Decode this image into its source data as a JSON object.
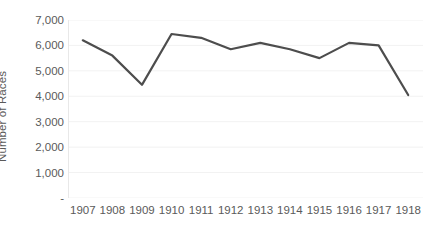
{
  "chart_data": {
    "type": "line",
    "title": "",
    "xlabel": "",
    "ylabel": "Number of Races",
    "categories": [
      "1907",
      "1908",
      "1909",
      "1910",
      "1911",
      "1912",
      "1913",
      "1914",
      "1915",
      "1916",
      "1917",
      "1918"
    ],
    "values": [
      6200,
      5600,
      4450,
      6450,
      6300,
      5850,
      6100,
      5850,
      5500,
      6100,
      6000,
      4050
    ],
    "series": [
      {
        "name": "Number of Races",
        "values": [
          6200,
          5600,
          4450,
          6450,
          6300,
          5850,
          6100,
          5850,
          5500,
          6100,
          6000,
          4050
        ]
      }
    ],
    "ylim": [
      0,
      7000
    ],
    "ytick_values": [
      0,
      1000,
      2000,
      3000,
      4000,
      5000,
      6000,
      7000
    ],
    "ytick_labels": [
      "-",
      "1,000",
      "2,000",
      "3,000",
      "4,000",
      "5,000",
      "6,000",
      "7,000"
    ],
    "grid": true,
    "grid_axis": "y",
    "legend": false,
    "legend_position": "none",
    "line_color": "#4d4d4d",
    "line_width": 2.2,
    "gridline_color": "#f2f2f2",
    "axis_line_color": "#e8e8e8",
    "text_color": "#5a5a5a",
    "background_color": "#ffffff",
    "markers": false,
    "annotations": []
  },
  "axes": {
    "y_title": "Number of Races"
  }
}
